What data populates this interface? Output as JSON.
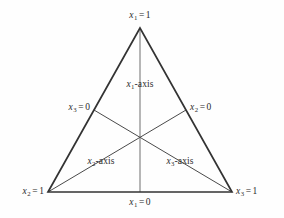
{
  "figure": {
    "type": "simplex-coordinate-triangle",
    "title": "",
    "background_color": "#fefefe",
    "line_color": "#3a3a3a",
    "axis_line_color": "#6e6e6e",
    "text_color": "#2b2b2b"
  },
  "vertices": {
    "top": {
      "label_x": "x",
      "label_sub": "1",
      "label_eq": "=",
      "label_val": "1",
      "full": "x1 = 1"
    },
    "bottom_left": {
      "label_x": "x",
      "label_sub": "2",
      "label_eq": "=",
      "label_val": "1",
      "full": "x2 = 1"
    },
    "bottom_right": {
      "label_x": "x",
      "label_sub": "3",
      "label_eq": "=",
      "label_val": "1",
      "full": "x3 = 1"
    }
  },
  "edge_labels": {
    "left": {
      "label_x": "x",
      "label_sub": "3",
      "label_eq": "=",
      "label_val": "0",
      "full": "x3 = 0"
    },
    "right": {
      "label_x": "x",
      "label_sub": "2",
      "label_eq": "=",
      "label_val": "0",
      "full": "x2 = 0"
    },
    "bottom": {
      "label_x": "x",
      "label_sub": "1",
      "label_eq": "=",
      "label_val": "0",
      "full": "x1 = 0"
    }
  },
  "axis_labels": {
    "x1": {
      "label_x": "x",
      "label_sub": "1",
      "suffix": "-axis",
      "full": "x1-axis"
    },
    "x2": {
      "label_x": "x",
      "label_sub": "2",
      "suffix": "-axis",
      "full": "x2-axis"
    },
    "x3": {
      "label_x": "x",
      "label_sub": "3",
      "suffix": "-axis",
      "full": "x3-axis"
    }
  },
  "geometry": {
    "apex": [
      140,
      28
    ],
    "bottom_left": [
      48,
      192
    ],
    "bottom_right": [
      232,
      192
    ],
    "centroid": [
      140,
      137
    ],
    "left_edge_midpoint": [
      94,
      110
    ],
    "right_edge_midpoint": [
      186,
      110
    ],
    "bottom_edge_midpoint": [
      140,
      192
    ]
  }
}
